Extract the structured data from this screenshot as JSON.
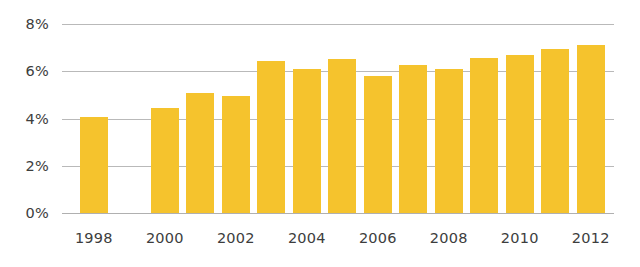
{
  "chart_data": {
    "type": "bar",
    "title": "",
    "subtitle": "",
    "xlabel": "",
    "ylabel": "",
    "categories": [
      "1998",
      "1999",
      "2000",
      "2001",
      "2002",
      "2003",
      "2004",
      "2005",
      "2006",
      "2007",
      "2008",
      "2009",
      "2010",
      "2011",
      "2012"
    ],
    "values": [
      4.05,
      null,
      4.45,
      5.1,
      4.95,
      6.45,
      6.1,
      6.5,
      5.8,
      6.25,
      6.1,
      6.55,
      6.7,
      6.95,
      7.1
    ],
    "value_unit": "%",
    "missing_categories": [
      "1999"
    ],
    "ylim": [
      0,
      8
    ],
    "ytick_values": [
      0,
      2,
      4,
      6,
      8
    ],
    "ytick_labels": [
      "0%",
      "2%",
      "4%",
      "6%",
      "8%"
    ],
    "xtick_labels": [
      "1998",
      "2000",
      "2002",
      "2004",
      "2006",
      "2008",
      "2010",
      "2012"
    ],
    "grid": true,
    "grid_axis": "y",
    "legend": false,
    "legend_position": "none",
    "series": [
      {
        "name": "",
        "color": "#F5C32D",
        "values": [
          4.05,
          null,
          4.45,
          5.1,
          4.95,
          6.45,
          6.1,
          6.5,
          5.8,
          6.25,
          6.1,
          6.55,
          6.7,
          6.95,
          7.1
        ]
      }
    ],
    "colors": {
      "bar": "#F5C32D",
      "gridline": "#b9b9b9",
      "baseline": "#b0b0b0",
      "axis_text": "#3d3d3d",
      "background": "#ffffff"
    }
  }
}
